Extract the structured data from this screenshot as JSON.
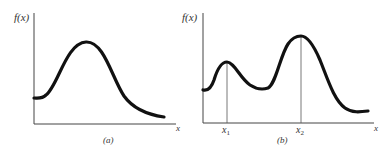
{
  "figure": {
    "panel_a": {
      "y_label": "f(x)",
      "x_label": "x",
      "caption": "(a)",
      "description": "Unimodal function with a single maximum"
    },
    "panel_b": {
      "y_label": "f(x)",
      "x_label": "x",
      "caption": "(b)",
      "x1_label": "x",
      "x1_sub": "1",
      "x2_label": "x",
      "x2_sub": "2",
      "description": "Bimodal function with local maximum at x1 and global maximum at x2"
    }
  },
  "colors": {
    "curve": "#111111",
    "axis": "#444444",
    "marker_line": "#555555",
    "text": "#333333"
  }
}
